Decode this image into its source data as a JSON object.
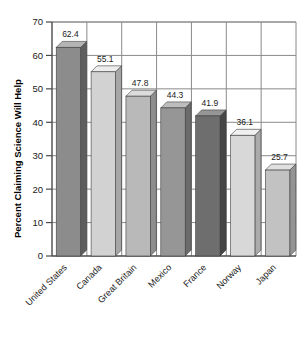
{
  "chart_data": {
    "type": "bar",
    "title": "",
    "subtitle": "",
    "xlabel": "",
    "ylabel": "Percent Claiming Science Will Help",
    "ylim": [
      0,
      70
    ],
    "ytick_step": 10,
    "yticks": [
      "0",
      "10",
      "20",
      "30",
      "40",
      "50",
      "60",
      "70"
    ],
    "grid": true,
    "grid_horizontal": true,
    "grid_vertical": true,
    "legend": false,
    "legend_position": "none",
    "style": "3d-bars",
    "categories": [
      "United States",
      "Canada",
      "Great Britain",
      "Mexico",
      "France",
      "Norway",
      "Japan"
    ],
    "values": [
      62.4,
      55.1,
      47.8,
      44.3,
      41.9,
      36.1,
      25.7
    ],
    "value_labels": [
      "62.4",
      "55.1",
      "47.8",
      "44.3",
      "41.9",
      "36.1",
      "25.7"
    ],
    "bar_colors": [
      "#8c8c8c",
      "#d2d2d2",
      "#b9b9b9",
      "#969696",
      "#6e6e6e",
      "#d8d8d8",
      "#c2c2c2"
    ],
    "bar_top_colors": [
      "#b4b4b4",
      "#ededed",
      "#dcdcdc",
      "#bdbdbd",
      "#969696",
      "#f0f0f0",
      "#e0e0e0"
    ],
    "bar_side_colors": [
      "#5e5e5e",
      "#a6a6a6",
      "#8e8e8e",
      "#6b6b6b",
      "#464646",
      "#ababab",
      "#949494"
    ],
    "category_label_rotation": -45,
    "axis_color": "#4a4a4a",
    "grid_color": "#8a8a8a",
    "text_color": "#1a1a1a",
    "background": "#ffffff"
  },
  "axes": {
    "y_axis_title": "Percent Claiming Science Will Help"
  }
}
